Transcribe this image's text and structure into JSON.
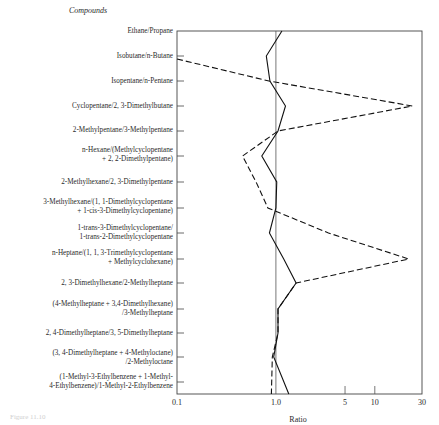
{
  "heading": "Compounds",
  "caption": "Figure 11.10",
  "chart_data": {
    "type": "line",
    "orientation": "horizontal-categories",
    "title": "",
    "ylabel": "Compounds",
    "xlabel": "Ratio",
    "xscale": "log",
    "xlim": [
      0.1,
      30
    ],
    "xticks": [
      "0.1",
      "1.0",
      "5",
      "10",
      "30"
    ],
    "reference_line": 1.0,
    "grid": false,
    "categories": [
      "Ethane/Propane",
      "Isobutane/n-Butane",
      "Isopentane/n-Pentane",
      "Cyclopentane/2, 3-Dimethylbutane",
      "2-Methylpentane/3-Methylpentane",
      "n-Hexane/(Methylcyclopentane + 2, 2-Dimethylpentane)",
      "2-Methylhexane/2, 3-Dimethylpentane",
      "3-Methylhexane/(1, 1-Dimethylcyclopentane + 1-cis-3-Dimethylcyclopentane)",
      "1-trans-3-Dimethylcyclopentane/1-trans-2-Dimethylcyclopentane",
      "n-Heptane/(1, 1, 3-Trimethylcyclopentane + Methylcyclohexane)",
      "2, 3-Dimethylhexane/2-Methylheptane",
      "(4-Methylheptane + 3,4-Dimethylhexane)/3-Methylheptane",
      "2, 4-Dimethylheptane/3, 5-Dimethylheptane",
      "(3, 4-Dimethylheptane + 4-Methyloctane)/2-Methyloctane",
      "(1-Methyl-3-Ethylbenzene + 1-Methyl-4-Ethylbenzene)/1-Methyl-2-Ethylbenzene"
    ],
    "series": [
      {
        "name": "solid",
        "style": "solid",
        "values": [
          1.15,
          0.8,
          0.87,
          1.25,
          1.05,
          0.72,
          1.02,
          1.0,
          0.86,
          1.2,
          1.6,
          1.05,
          1.05,
          0.95,
          1.35
        ]
      },
      {
        "name": "dashed",
        "style": "dashed",
        "values": [
          null,
          0.1,
          0.85,
          24,
          1.05,
          0.46,
          0.63,
          0.83,
          3.4,
          22,
          1.6,
          1.05,
          1.05,
          0.92,
          0.9
        ]
      }
    ]
  },
  "labels": [
    {
      "lines": [
        "Ethane/Propane"
      ],
      "y": 27
    },
    {
      "lines": [
        "Isobutane/n-Butane"
      ],
      "y": 52
    },
    {
      "lines": [
        "Isopentane/n-Pentane"
      ],
      "y": 77
    },
    {
      "lines": [
        "Cyclopentane/2, 3-Dimethylbutane"
      ],
      "y": 102
    },
    {
      "lines": [
        "2-Methylpentane/3-Methylpentane"
      ],
      "y": 126
    },
    {
      "lines": [
        "n-Hexane/(Methylcyclopentane",
        "+ 2, 2-Dimethylpentane)"
      ],
      "y": 146
    },
    {
      "lines": [
        "2-Methylhexane/2, 3-Dimethylpentane"
      ],
      "y": 178
    },
    {
      "lines": [
        "3-Methylhexane/(1, 1-Dimethylcyclopentane",
        "+ 1-cis-3-Dimethylcyclopentane)"
      ],
      "y": 198
    },
    {
      "lines": [
        "1-trans-3-Dimethylcyclopentane/",
        "1-trans-2-Dimethylcyclopentane"
      ],
      "y": 224
    },
    {
      "lines": [
        "n-Heptane/(1, 1, 3-Trimethylcyclopentane",
        "+ Methylcyclohexane)"
      ],
      "y": 249
    },
    {
      "lines": [
        "2, 3-Dimethylhexane/2-Methylheptane"
      ],
      "y": 279
    },
    {
      "lines": [
        "(4-Methylheptane + 3,4-Dimethylhexane)",
        "/3-Methylheptane"
      ],
      "y": 300
    },
    {
      "lines": [
        "2, 4-Dimethylheptane/3, 5-Dimethylheptane"
      ],
      "y": 329
    },
    {
      "lines": [
        "(3, 4-Dimethylheptane + 4-Methyloctane)",
        "/2-Methyloctane"
      ],
      "y": 349
    },
    {
      "lines": [
        "(1-Methyl-3-Ethylbenzene + 1-Methyl-",
        "4-Ethylbenzene)/1-Methyl-2-Ethylbenzene"
      ],
      "y": 373
    }
  ]
}
